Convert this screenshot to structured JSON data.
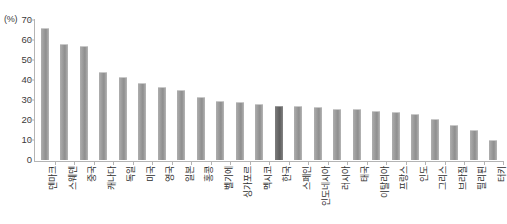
{
  "chart_data": {
    "type": "bar",
    "title": "",
    "subtitle": "",
    "xlabel": "",
    "ylabel": "(%)",
    "unit_label": "(%)",
    "ylim": [
      0,
      70
    ],
    "yticks": [
      0,
      10,
      20,
      30,
      40,
      50,
      60,
      70
    ],
    "ytick_labels": [
      "0",
      "10",
      "20",
      "30",
      "40",
      "50",
      "60",
      "70"
    ],
    "grid": false,
    "legend": "none",
    "highlight_category": "한국",
    "highlight_color": "#686868",
    "bar_color": "#9a9a9a",
    "axis_color": "#b4b4b4",
    "categories": [
      "덴마크",
      "스웨덴",
      "중국",
      "캐나다",
      "독일",
      "미국",
      "영국",
      "일본",
      "홍콩",
      "벨기에",
      "싱가포르",
      "멕시코",
      "한국",
      "스페인",
      "인도네시아",
      "러시아",
      "태국",
      "이탈리아",
      "프랑스",
      "인도",
      "그리스",
      "브라질",
      "필리핀",
      "터키"
    ],
    "values": [
      66,
      58,
      57,
      44,
      41.5,
      38.5,
      36.5,
      35,
      31.5,
      29.5,
      29,
      28,
      27,
      27,
      26.5,
      25.5,
      25.5,
      24.5,
      24,
      23,
      20.5,
      17.5,
      15,
      10
    ]
  }
}
